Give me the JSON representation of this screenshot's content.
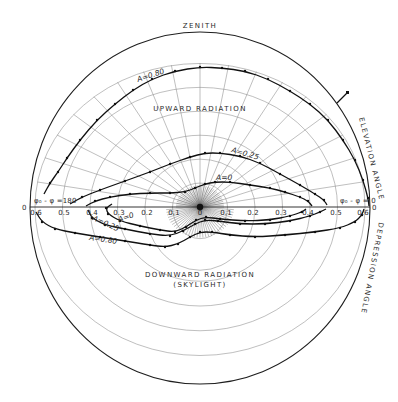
{
  "figure": {
    "top_label": "ZENITH",
    "upper_region_label": "UPWARD RADIATION",
    "lower_region_label": "DOWNWARD RADIATION",
    "lower_region_sublabel": "(SKYLIGHT)",
    "right_upper_label": "ELEVATION ANGLE",
    "right_lower_label": "DEPRESSION ANGLE",
    "azimuth_left": "φ₀ - φ =180",
    "azimuth_right": "φ₀ - φ = 0",
    "axis_end_left": "0",
    "axis_end_right": "0"
  },
  "axis": {
    "ticks_left": [
      "0.6",
      "0.5",
      "0.4",
      "0.3",
      "0.2",
      "0.1"
    ],
    "center": "0",
    "ticks_right": [
      "0.1",
      "0.2",
      "0.3",
      "0.4",
      "0.5",
      "0.6"
    ]
  },
  "curves": [
    {
      "label": "A=0.80",
      "half": "upward",
      "points": [
        [
          44,
          194
        ],
        [
          50,
          183
        ],
        [
          58,
          172
        ],
        [
          67,
          158
        ],
        [
          80,
          140
        ],
        [
          97,
          120
        ],
        [
          115,
          104
        ],
        [
          133,
          90
        ],
        [
          152,
          79
        ],
        [
          175,
          71
        ],
        [
          200,
          67
        ],
        [
          222,
          68
        ],
        [
          245,
          71
        ],
        [
          268,
          79
        ],
        [
          290,
          91
        ],
        [
          310,
          104
        ],
        [
          328,
          120
        ],
        [
          343,
          140
        ],
        [
          355,
          160
        ],
        [
          363,
          180
        ],
        [
          368,
          198
        ],
        [
          369,
          206
        ]
      ]
    },
    {
      "label": "A=0.25",
      "half": "upward",
      "points": [
        [
          70,
          204
        ],
        [
          82,
          197
        ],
        [
          100,
          190
        ],
        [
          125,
          181
        ],
        [
          150,
          172
        ],
        [
          170,
          164
        ],
        [
          190,
          157
        ],
        [
          205,
          153
        ],
        [
          220,
          153
        ],
        [
          240,
          156
        ],
        [
          260,
          163
        ],
        [
          280,
          174
        ],
        [
          300,
          185
        ],
        [
          315,
          194
        ],
        [
          324,
          200
        ],
        [
          327,
          205
        ]
      ]
    },
    {
      "label": "A=0",
      "half": "upward",
      "points": [
        [
          86,
          206
        ],
        [
          95,
          201
        ],
        [
          110,
          197
        ],
        [
          130,
          194
        ],
        [
          150,
          193
        ],
        [
          170,
          193
        ],
        [
          185,
          192
        ],
        [
          195,
          188
        ],
        [
          205,
          184
        ],
        [
          215,
          182
        ],
        [
          230,
          182
        ],
        [
          250,
          185
        ],
        [
          270,
          188
        ],
        [
          285,
          192
        ],
        [
          300,
          197
        ],
        [
          308,
          201
        ],
        [
          312,
          206
        ]
      ]
    },
    {
      "label": "A=0.80",
      "half": "downward",
      "points": [
        [
          36,
          212
        ],
        [
          42,
          222
        ],
        [
          55,
          229
        ],
        [
          75,
          233
        ],
        [
          100,
          237
        ],
        [
          125,
          241
        ],
        [
          150,
          245
        ],
        [
          165,
          247
        ],
        [
          178,
          244
        ],
        [
          190,
          237
        ],
        [
          200,
          232
        ],
        [
          212,
          232
        ],
        [
          230,
          235
        ],
        [
          255,
          237
        ],
        [
          285,
          235
        ],
        [
          315,
          232
        ],
        [
          340,
          228
        ],
        [
          355,
          222
        ],
        [
          362,
          215
        ],
        [
          364,
          209
        ]
      ]
    },
    {
      "label": "A=0.25",
      "half": "downward",
      "points": [
        [
          88,
          210
        ],
        [
          92,
          218
        ],
        [
          105,
          225
        ],
        [
          125,
          229
        ],
        [
          150,
          234
        ],
        [
          170,
          236
        ],
        [
          183,
          231
        ],
        [
          195,
          224
        ],
        [
          205,
          220
        ],
        [
          218,
          221
        ],
        [
          240,
          224
        ],
        [
          265,
          224
        ],
        [
          290,
          221
        ],
        [
          310,
          216
        ],
        [
          320,
          212
        ],
        [
          326,
          209
        ]
      ]
    },
    {
      "label": "A=0",
      "half": "downward",
      "points": [
        [
          112,
          204
        ],
        [
          106,
          208
        ],
        [
          108,
          214
        ],
        [
          120,
          221
        ],
        [
          140,
          226
        ],
        [
          160,
          230
        ],
        [
          175,
          232
        ],
        [
          186,
          227
        ],
        [
          196,
          220
        ],
        [
          206,
          217
        ],
        [
          220,
          219
        ],
        [
          245,
          221
        ],
        [
          270,
          220
        ],
        [
          290,
          216
        ],
        [
          302,
          212
        ],
        [
          306,
          209
        ]
      ]
    }
  ]
}
